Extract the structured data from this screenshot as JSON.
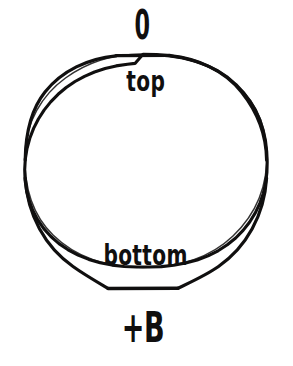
{
  "figure": {
    "kind": "circle-cross-section-diagram",
    "background_color": "#ffffff",
    "ink_color": "#100f0f",
    "canvas": {
      "width": 293,
      "height": 366
    },
    "shape": {
      "name": "circle-outline",
      "center_x": 143,
      "center_y": 172,
      "radius_x": 125,
      "radius_y": 118,
      "stroke_width": 3,
      "filled": false,
      "fill_color": "#ffffff",
      "stroke_color": "#100f0f",
      "style": "hand-drawn scanned outline"
    },
    "labels": {
      "above_circle": "0",
      "inside_top": "top",
      "inside_bottom": "bottom",
      "below_circle": "+B"
    },
    "label_positions": {
      "above_circle": {
        "x": 135,
        "y": 26,
        "anchor": "center"
      },
      "inside_top": {
        "x": 143,
        "y": 84,
        "anchor": "center"
      },
      "inside_bottom": {
        "x": 142,
        "y": 258,
        "anchor": "center"
      },
      "below_circle": {
        "x": 135,
        "y": 328,
        "anchor": "center"
      }
    }
  }
}
